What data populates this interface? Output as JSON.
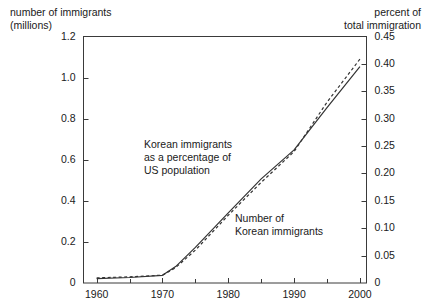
{
  "chart_data": {
    "type": "line",
    "title": "",
    "xlabel": "",
    "left_axis_label": "number of immigrants\n(millions)",
    "right_axis_label": "percent of\ntotal immigration",
    "x": [
      1960,
      1965,
      1970,
      1972,
      1975,
      1980,
      1985,
      1990,
      1995,
      2000
    ],
    "xlim": [
      1958,
      2001
    ],
    "xticks": [
      1960,
      1970,
      1980,
      1990,
      2000
    ],
    "xtick_labels": [
      "1960",
      "1970",
      "1980",
      "1990",
      "2000"
    ],
    "xminor_ticks": [
      1965,
      1975,
      1985,
      1995
    ],
    "left_ylim": [
      0,
      1.2
    ],
    "left_yticks": [
      0,
      0.2,
      0.4,
      0.6,
      0.8,
      1.0,
      1.2
    ],
    "left_ytick_labels": [
      "0",
      "0.2",
      "0.4",
      "0.6",
      "0.8",
      "1.0",
      "1.2"
    ],
    "right_ylim": [
      0,
      0.45
    ],
    "right_yticks": [
      0,
      0.05,
      0.1,
      0.15,
      0.2,
      0.25,
      0.3,
      0.35,
      0.4,
      0.45
    ],
    "right_ytick_labels": [
      "0",
      "0.05",
      "0.10",
      "0.15",
      "0.20",
      "0.25",
      "0.30",
      "0.35",
      "0.40",
      "0.45"
    ],
    "grid": false,
    "legend_position": "inline-annotations",
    "series": [
      {
        "name": "Korean immigrants as a percentage of US population",
        "axis": "right",
        "style": "solid",
        "color": "#333333",
        "values": [
          0.008,
          0.01,
          0.014,
          0.03,
          0.065,
          0.128,
          0.19,
          0.243,
          0.32,
          0.395
        ]
      },
      {
        "name": "Number of Korean immigrants",
        "axis": "left",
        "style": "dashed",
        "color": "#333333",
        "values": [
          0.025,
          0.03,
          0.038,
          0.075,
          0.16,
          0.33,
          0.49,
          0.64,
          0.88,
          1.09
        ]
      }
    ],
    "annotations": [
      {
        "id": "annotation-percentage",
        "text": "Korean immigrants\nas a percentage of\nUS population",
        "x_px": 144,
        "y_px": 138
      },
      {
        "id": "annotation-number",
        "text": "Number of\nKorean immigrants",
        "x_px": 235,
        "y_px": 212
      }
    ]
  }
}
